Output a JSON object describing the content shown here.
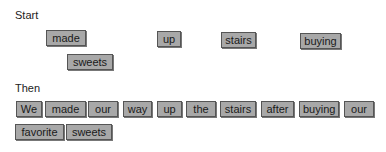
{
  "start": {
    "label": "Start",
    "tiles": [
      {
        "word": "made",
        "x": 46,
        "y": 30,
        "w": 32
      },
      {
        "word": "up",
        "x": 157,
        "y": 31,
        "w": 16
      },
      {
        "word": "stairs",
        "x": 221,
        "y": 32,
        "w": 27
      },
      {
        "word": "buying",
        "x": 300,
        "y": 33,
        "w": 33
      },
      {
        "word": "sweets",
        "x": 67,
        "y": 54,
        "w": 38
      }
    ]
  },
  "then": {
    "label": "Then",
    "tiles": [
      {
        "word": "We",
        "x": 16,
        "y": 101,
        "w": 18
      },
      {
        "word": "made",
        "x": 45,
        "y": 101,
        "w": 33
      },
      {
        "word": "our",
        "x": 88,
        "y": 101,
        "w": 22
      },
      {
        "word": "way",
        "x": 123,
        "y": 101,
        "w": 21
      },
      {
        "word": "up",
        "x": 157,
        "y": 101,
        "w": 17
      },
      {
        "word": "the",
        "x": 186,
        "y": 101,
        "w": 22
      },
      {
        "word": "stairs",
        "x": 220,
        "y": 101,
        "w": 28
      },
      {
        "word": "after",
        "x": 261,
        "y": 101,
        "w": 25
      },
      {
        "word": "buying",
        "x": 299,
        "y": 101,
        "w": 32
      },
      {
        "word": "our",
        "x": 344,
        "y": 101,
        "w": 22
      },
      {
        "word": "favorite",
        "x": 15,
        "y": 124,
        "w": 41
      },
      {
        "word": "sweets",
        "x": 66,
        "y": 124,
        "w": 38
      }
    ]
  }
}
